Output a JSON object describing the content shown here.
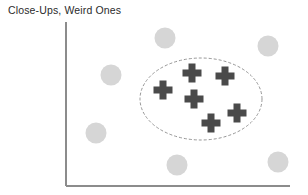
{
  "figure": {
    "title": "Close-Ups, Weird Ones",
    "width": 308,
    "height": 195,
    "background_color": "#ffffff"
  },
  "axes": {
    "name": "scatter-plot-axes",
    "x_axis": {
      "x1": 66,
      "y1": 186,
      "x2": 290,
      "y2": 186,
      "color": "#8c8c8c",
      "tick_labels": []
    },
    "y_axis": {
      "x1": 66,
      "y1": 22,
      "x2": 66,
      "y2": 186,
      "color": "#8c8c8c",
      "tick_labels": []
    },
    "xlabel": "",
    "ylabel": "",
    "grid": false
  },
  "annotation": {
    "name": "cluster-ellipse",
    "shape": "ellipse",
    "cx": 201,
    "cy": 99,
    "rx": 61,
    "ry": 41,
    "stroke_color": "#8a8a8a",
    "dashed": true,
    "label": ""
  },
  "chart_data": {
    "type": "scatter",
    "title": "Close-Ups, Weird Ones",
    "xlabel": "",
    "ylabel": "",
    "xlim": [
      66,
      290
    ],
    "ylim": [
      22,
      186
    ],
    "grid": false,
    "legend": null,
    "annotations": [
      {
        "type": "ellipse",
        "label": "cluster boundary",
        "cx": 201,
        "cy": 99,
        "rx": 61,
        "ry": 41,
        "style": "dashed",
        "color": "#8a8a8a"
      }
    ],
    "series": [
      {
        "name": "Close-Ups",
        "marker": "cross",
        "color": "#4a4a4a",
        "size": 19,
        "thickness": 7,
        "count": 6,
        "points": [
          {
            "x": 163,
            "y": 90
          },
          {
            "x": 192,
            "y": 73
          },
          {
            "x": 225,
            "y": 76
          },
          {
            "x": 194,
            "y": 99
          },
          {
            "x": 211,
            "y": 123
          },
          {
            "x": 237,
            "y": 113
          }
        ]
      },
      {
        "name": "Weird Ones",
        "marker": "circle",
        "color": "#d6d6d6",
        "size": 21,
        "count": 6,
        "points": [
          {
            "x": 165,
            "y": 38
          },
          {
            "x": 268,
            "y": 46
          },
          {
            "x": 111,
            "y": 75
          },
          {
            "x": 96,
            "y": 133
          },
          {
            "x": 177,
            "y": 165
          },
          {
            "x": 278,
            "y": 162
          }
        ]
      }
    ]
  }
}
